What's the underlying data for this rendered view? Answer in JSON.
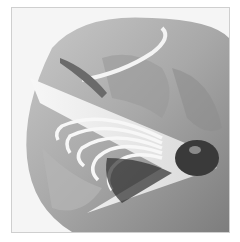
{
  "image": {
    "description": "Grayscale photo of a hand holding a carved wooden feather stick with curled shavings and a charred tip",
    "colors": {
      "background": "#ffffff",
      "border": "#cfcfcf",
      "skin_light": "#bdbdbd",
      "skin_dark": "#7a7a7a",
      "wood": "#f2f2f2",
      "char": "#3a3a3a"
    }
  }
}
